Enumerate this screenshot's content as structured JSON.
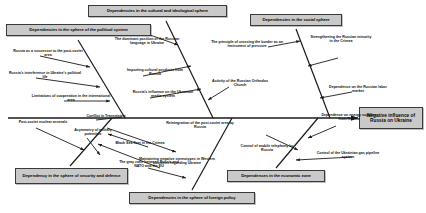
{
  "diagram": {
    "type": "fishbone-ishikawa",
    "effect": {
      "label": "Negative influence of Russia on Ukraine"
    },
    "spine_label": "",
    "categories": [
      {
        "id": "political",
        "label": "Dependencies in the sphere of the political system",
        "position": "top-left",
        "causes": [
          "Russia as a successor to the post-soviet area",
          "Russia's interference in Ukraine's political life",
          "Limitations of cooperation in the international area",
          "Conflict in Transnistria"
        ]
      },
      {
        "id": "cultural",
        "label": "Dependencies in the cultural and ideological sphere",
        "position": "top-center",
        "causes": [
          "The dominant position of the Russian language in Ukraine",
          "Importing cultural products from Russia",
          "Russia's influence on the Ukrainian media system",
          "Activity of the Russian Orthodox Church"
        ]
      },
      {
        "id": "social",
        "label": "Dependencies in the social sphere",
        "position": "top-right",
        "causes": [
          "The principle of crossing the border as an instrument of pressure",
          "Strengthening the Russian minority in the Crimea",
          "Dependence on the Russian labor market"
        ]
      },
      {
        "id": "security",
        "label": "Dependency in the sphere of security and defense",
        "position": "bottom-left",
        "causes": [
          "Post-soviet nuclear arsenals",
          "Asymmetry of military potentials",
          "Black Sea fleet in the Crimea",
          "The gray zone between Russia and NATO and the EU"
        ]
      },
      {
        "id": "foreign-policy",
        "label": "Dependencies in the sphere of foreign policy",
        "position": "bottom-center",
        "causes": [
          "Reintegration of the post-soviet area by Russia",
          "Maintaining negative stereotypes in Western countries regarding Ukraine"
        ]
      },
      {
        "id": "economic",
        "label": "Dependences in the economic zone",
        "position": "bottom-right",
        "causes": [
          "Control of mobile telephony by Russia",
          "Dependence on energy supplies from Russia",
          "Control of the Ukrainian gas pipeline system"
        ]
      }
    ],
    "colors": {
      "box_fill": "#c9c9c9",
      "box_border": "#3a3a3a",
      "line": "#1a1a1a",
      "text": "#111111",
      "background": "#ffffff"
    }
  }
}
